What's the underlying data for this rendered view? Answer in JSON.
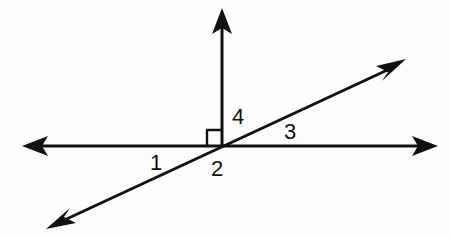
{
  "figure": {
    "background_color": "#fdfdfd",
    "stroke_color": "#111111",
    "width": 450,
    "height": 236
  },
  "labels": {
    "angle1": "1",
    "angle2": "2",
    "angle3": "3",
    "angle4": "4"
  },
  "label_positions": {
    "angle1": {
      "x": 150,
      "y": 152
    },
    "angle2": {
      "x": 211,
      "y": 158
    },
    "angle3": {
      "x": 284,
      "y": 121
    },
    "angle4": {
      "x": 232,
      "y": 106
    }
  },
  "geometry": {
    "intersection": {
      "x": 222,
      "y": 146
    },
    "horizontal_line": {
      "name": "horizontal-line",
      "x1": 26,
      "y1": 146,
      "x2": 434,
      "y2": 146,
      "arrow_left": true,
      "arrow_right": true
    },
    "vertical_ray": {
      "name": "vertical-ray",
      "x1": 222,
      "y1": 146,
      "x2": 222,
      "y2": 12,
      "arrow_up": true
    },
    "diagonal_line": {
      "name": "diagonal-line",
      "x1": 52,
      "y1": 226,
      "x2": 400,
      "y2": 64,
      "arrow_lower_left": true,
      "arrow_upper_right": true
    },
    "right_angle_marker": {
      "name": "right-angle-marker",
      "x": 207,
      "y": 130,
      "size": 15,
      "quadrant": "upper-left"
    }
  }
}
